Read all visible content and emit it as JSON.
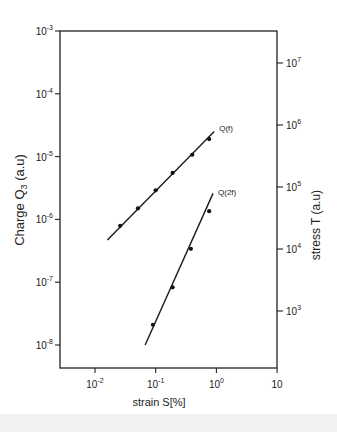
{
  "chart_data": {
    "type": "line",
    "title": "",
    "xlabel": "strain S[%]",
    "ylabel": "Charge Q3 (a.u)",
    "ylabel_right": "stress T (a.u)",
    "xscale": "log",
    "yscale": "log",
    "xlim": [
      0.003,
      10
    ],
    "ylim": [
      1e-08,
      0.001
    ],
    "ylim_right": [
      100.0,
      100000000.0
    ],
    "grid": false,
    "x_ticks": [
      {
        "label_base": "10",
        "label_exp": "-2",
        "value": 0.01
      },
      {
        "label_base": "10",
        "label_exp": "-1",
        "value": 0.1
      },
      {
        "label_base": "10",
        "label_exp": "0",
        "value": 1
      },
      {
        "label_base": "10",
        "label_exp": "",
        "value": 10
      }
    ],
    "y_ticks_left": [
      {
        "label_base": "10",
        "label_exp": "-3",
        "value": 0.001
      },
      {
        "label_base": "10",
        "label_exp": "-4",
        "value": 0.0001
      },
      {
        "label_base": "10",
        "label_exp": "-5",
        "value": 1e-05
      },
      {
        "label_base": "10",
        "label_exp": "-6",
        "value": 1e-06
      },
      {
        "label_base": "10",
        "label_exp": "-7",
        "value": 1e-07
      },
      {
        "label_base": "10",
        "label_exp": "-8",
        "value": 1e-08
      }
    ],
    "y_ticks_right": [
      {
        "label_base": "10",
        "label_exp": "7",
        "value": 10000000.0
      },
      {
        "label_base": "10",
        "label_exp": "6",
        "value": 1000000.0
      },
      {
        "label_base": "10",
        "label_exp": "5",
        "value": 100000.0
      },
      {
        "label_base": "10",
        "label_exp": "4",
        "value": 10000.0
      },
      {
        "label_base": "10",
        "label_exp": "3",
        "value": 1000.0
      }
    ],
    "series": [
      {
        "name": "Q(f)",
        "label": "Q(f)",
        "x": [
          0.026,
          0.051,
          0.1,
          0.19,
          0.4,
          0.76
        ],
        "y": [
          7.9e-07,
          1.5e-06,
          2.9e-06,
          5.5e-06,
          1.07e-05,
          1.9e-05
        ],
        "fit_line": {
          "x": [
            0.016,
            0.92
          ],
          "y": [
            4.7e-07,
            2.5e-05
          ]
        }
      },
      {
        "name": "Q(2f)",
        "label": "Q(2f)",
        "x": [
          0.09,
          0.19,
          0.38,
          0.76
        ],
        "y": [
          2.1e-08,
          8.3e-08,
          3.4e-07,
          1.35e-06
        ],
        "fit_line": {
          "x": [
            0.067,
            0.88
          ],
          "y": [
            1e-08,
            2.6e-06
          ]
        }
      }
    ],
    "legend": {
      "position": "inline-labels"
    }
  },
  "labels": {
    "ylabel_main": "Charge Q",
    "ylabel_sub": "3",
    "ylabel_unit": " (a.u)",
    "ylabel_right": "stress T (a.u)",
    "xlabel": "strain S[%]",
    "series0": "Q(f)",
    "series1": "Q(2f)"
  }
}
